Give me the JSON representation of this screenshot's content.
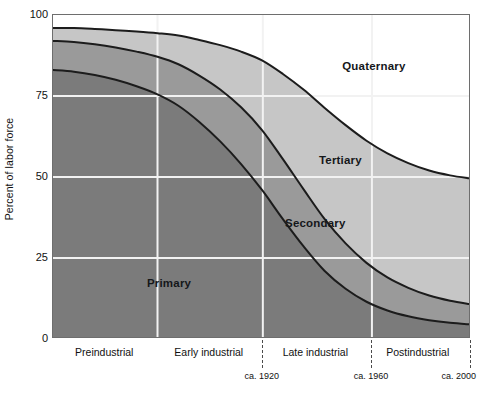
{
  "chart_data": {
    "type": "area",
    "title": "",
    "subtitle": "",
    "xlabel": "",
    "ylabel": "Percent of labor force",
    "ylim": [
      0,
      100
    ],
    "xlim": [
      0,
      100
    ],
    "grid": true,
    "stacked": true,
    "legend_position": "inline-annotations",
    "y_ticks": [
      {
        "value": 100,
        "label": "100"
      },
      {
        "value": 75,
        "label": "75"
      },
      {
        "value": 50,
        "label": "50"
      },
      {
        "value": 25,
        "label": "25"
      },
      {
        "value": 0,
        "label": "0"
      }
    ],
    "x_eras": [
      {
        "label": "Preindustrial",
        "center": 12.5
      },
      {
        "label": "Early industrial",
        "center": 37.5
      },
      {
        "label": "Late industrial",
        "center": 63.0
      },
      {
        "label": "Postindustrial",
        "center": 87.5
      }
    ],
    "x_markers": [
      {
        "label": "ca. 1920",
        "x": 50.2
      },
      {
        "label": "ca. 1960",
        "x": 76.3
      },
      {
        "label": "ca. 2000",
        "x": 100.0
      }
    ],
    "x_gridlines": [
      25.0,
      50.2,
      76.3
    ],
    "x": [
      0,
      5,
      10,
      15,
      20,
      25,
      30,
      35,
      40,
      45,
      50,
      55,
      60,
      65,
      70,
      75,
      80,
      85,
      90,
      95,
      100
    ],
    "series": [
      {
        "name": "Primary",
        "color": "#7b7b7b",
        "label_x": 28.0,
        "label_y": 17.0,
        "values": [
          83,
          82.5,
          81.5,
          80,
          78,
          75.5,
          72,
          67,
          61,
          54,
          46,
          37,
          28.5,
          21,
          15.5,
          11.5,
          8.8,
          7,
          5.8,
          5,
          4.5
        ]
      },
      {
        "name": "Secondary",
        "color": "#9a9a9a",
        "label_x": 63.0,
        "label_y": 35.5,
        "values": [
          9,
          9.2,
          9.5,
          10,
          10.7,
          11.6,
          12.8,
          14.3,
          16,
          17.5,
          18.5,
          18.5,
          17.6,
          16,
          14,
          12,
          10.2,
          8.8,
          7.6,
          6.8,
          6.2
        ],
        "cumulative_top": [
          92,
          91.7,
          91,
          90,
          88.7,
          87.1,
          84.8,
          81.3,
          77,
          71.5,
          64.5,
          55.5,
          46.1,
          37,
          29.5,
          23.5,
          19,
          15.8,
          13.4,
          11.8,
          10.7
        ]
      },
      {
        "name": "Tertiary",
        "color": "#c6c6c6",
        "label_x": 69.0,
        "label_y": 55.0,
        "values": [
          4,
          4.3,
          4.7,
          5.3,
          6.2,
          7.3,
          8.9,
          11,
          13.7,
          17.2,
          21.5,
          26.3,
          30.8,
          34.3,
          36.5,
          37.7,
          38.3,
          38.5,
          38.6,
          38.7,
          38.8
        ],
        "cumulative_top": [
          96,
          96,
          95.7,
          95.3,
          94.9,
          94.4,
          93.7,
          92.3,
          90.7,
          88.7,
          86,
          81.8,
          76.9,
          71.3,
          66,
          61.2,
          57.3,
          54.3,
          52,
          50.5,
          49.5
        ]
      },
      {
        "name": "Quaternary",
        "color": "#ffffff",
        "label_x": 77.0,
        "label_y": 84.0,
        "values": [
          4,
          4,
          4.3,
          4.7,
          5.1,
          5.6,
          6.3,
          7.7,
          9.3,
          11.3,
          14,
          18.2,
          23.1,
          28.7,
          34,
          38.8,
          42.7,
          45.7,
          48,
          49.5,
          50.5
        ],
        "cumulative_top": [
          100,
          100,
          100,
          100,
          100,
          100,
          100,
          100,
          100,
          100,
          100,
          100,
          100,
          100,
          100,
          100,
          100,
          100,
          100,
          100,
          100
        ]
      }
    ],
    "colors": {
      "primary_band": "#7b7b7b",
      "secondary_band": "#9a9a9a",
      "tertiary_band": "#c6c6c6",
      "quaternary_band": "#ffffff",
      "boundary_line": "#1c1c1c",
      "gridline": "#f2f2f2",
      "frame": "#6e6e6e",
      "text": "#111111"
    }
  }
}
